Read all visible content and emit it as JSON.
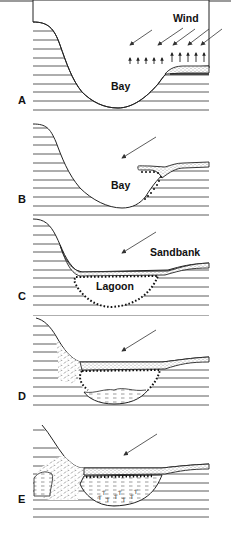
{
  "diagram": {
    "type": "coastal-lagoon-formation-sequence",
    "panels": [
      {
        "letter": "A",
        "labels": [
          "Wind",
          "Bay"
        ],
        "stage": "open bay with wind-driven sediment at spit"
      },
      {
        "letter": "B",
        "labels": [
          "Bay"
        ],
        "stage": "spit grows across bay"
      },
      {
        "letter": "C",
        "labels": [
          "Sandbank",
          "Lagoon"
        ],
        "stage": "sandbank closes bay forming lagoon"
      },
      {
        "letter": "D",
        "labels": [],
        "stage": "lagoon begins to infill with sediment"
      },
      {
        "letter": "E",
        "labels": [],
        "stage": "lagoon largely infilled with sediment and vegetation"
      }
    ],
    "colors": {
      "ink": "#222222",
      "background": "#ffffff",
      "top_rule": "#9a9a9a"
    }
  }
}
